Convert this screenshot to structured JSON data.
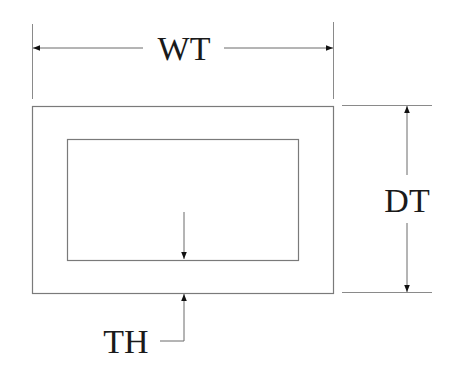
{
  "diagram": {
    "labels": {
      "width": "WT",
      "depth": "DT",
      "thickness": "TH"
    },
    "colors": {
      "line": "#7a7a7a",
      "text": "#1a1a1a",
      "arrow": "#111111",
      "background": "#ffffff"
    }
  }
}
